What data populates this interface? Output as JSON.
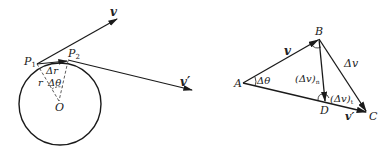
{
  "figure_left": {
    "title": "circular-motion-velocity-diagram",
    "labels": {
      "v": "v",
      "v_prime": "v′",
      "P1": "P",
      "P1_sub": "1",
      "P2": "P",
      "P2_sub": "2",
      "delta_r": "Δr",
      "r": "r",
      "delta_theta": "Δθ",
      "O": "O"
    }
  },
  "figure_right": {
    "title": "velocity-vector-triangle",
    "labels": {
      "A": "A",
      "B": "B",
      "C": "C",
      "D": "D",
      "v": "v",
      "v_prime": "v′",
      "delta_v": "Δv",
      "delta_theta": "Δθ",
      "delta_v_n": "(Δv)",
      "delta_v_n_sub": "n",
      "delta_v_t": "(Δv)",
      "delta_v_t_sub": "t"
    }
  },
  "colors": {
    "stroke": "#1a1a1a",
    "background": "#ffffff"
  }
}
